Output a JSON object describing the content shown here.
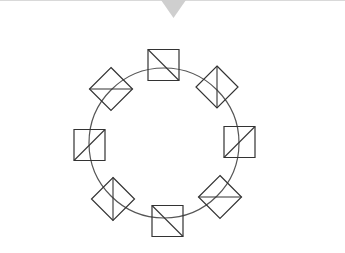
{
  "diagram": {
    "background": "#ffffff",
    "top_rule_color": "#d9d9d9",
    "pointer": {
      "shape": "triangle-down",
      "points": [
        [
          161,
          0
        ],
        [
          186,
          0
        ],
        [
          173.5,
          18
        ]
      ],
      "color": "#cfcfcf"
    },
    "ring": {
      "cx": 164,
      "cy": 143,
      "r": 75,
      "stroke": "#555555",
      "stroke_width": 1.2
    },
    "elements": [
      {
        "id": "top",
        "shape": "square",
        "cx": 163.5,
        "cy": 65,
        "half": 15.5,
        "diagonal": "tl-br"
      },
      {
        "id": "top-right",
        "shape": "diamond",
        "cx": 217,
        "cy": 87,
        "half": 21,
        "diagonal": "vertical"
      },
      {
        "id": "right",
        "shape": "square",
        "cx": 239.5,
        "cy": 142,
        "half": 15.5,
        "diagonal": "bl-tr"
      },
      {
        "id": "bottom-right",
        "shape": "diamond",
        "cx": 220,
        "cy": 197,
        "half": 21.5,
        "diagonal": "horizontal"
      },
      {
        "id": "bottom",
        "shape": "square",
        "cx": 167.5,
        "cy": 221,
        "half": 15.5,
        "diagonal": "tl-br"
      },
      {
        "id": "bottom-left",
        "shape": "diamond",
        "cx": 113,
        "cy": 199,
        "half": 21.5,
        "diagonal": "vertical"
      },
      {
        "id": "left",
        "shape": "square",
        "cx": 89.5,
        "cy": 145,
        "half": 15.5,
        "diagonal": "bl-tr"
      },
      {
        "id": "top-left",
        "shape": "diamond",
        "cx": 111,
        "cy": 89,
        "half": 21.5,
        "diagonal": "horizontal"
      }
    ],
    "element_stroke": "#333333",
    "element_fill": "none"
  }
}
